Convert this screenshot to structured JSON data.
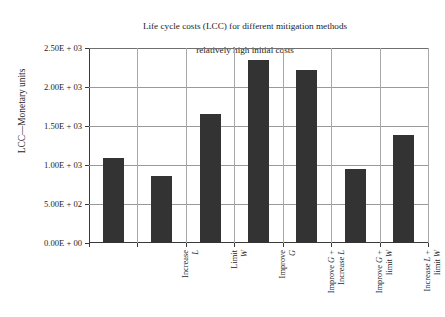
{
  "chart_data": {
    "type": "bar",
    "title": "Life cycle costs (LCC) for different mitigation methods\nrelatively high initial costs",
    "title_line1": "Life cycle costs (LCC) for different mitigation methods",
    "title_line2": "relatively high initial costs",
    "xlabel": "",
    "ylabel": "LCC—Monetary units",
    "categories": [
      "Increase L",
      "Limit W",
      "Improve G",
      "Improve G + Increase L",
      "Improve G + limit W",
      "Increase L + limit W",
      "Do nothing"
    ],
    "category_lines": [
      [
        "Increase ",
        "L"
      ],
      [
        "Limit ",
        "W"
      ],
      [
        "Improve ",
        "G"
      ],
      [
        "Improve G +",
        "Increase L"
      ],
      [
        "Improve G +",
        "limit W"
      ],
      [
        "Increase L +",
        "limit W"
      ],
      [
        "Do nothing",
        ""
      ]
    ],
    "values": [
      1090,
      860,
      1650,
      2350,
      2220,
      950,
      1390
    ],
    "ylim": [
      0,
      2500
    ],
    "yticks": [
      0,
      500,
      1000,
      1500,
      2000,
      2500
    ],
    "ytick_labels": [
      "0.00E + 00",
      "5.00E + 02",
      "1.00E + 03",
      "1.50E + 03",
      "2.00E + 03",
      "2.50E + 03"
    ],
    "grid": "both",
    "legend": "none",
    "bar_color": "#333333",
    "grid_color": "#9a9a9a",
    "axis_color": "#3a3a3a",
    "background_color": "#ffffff"
  }
}
